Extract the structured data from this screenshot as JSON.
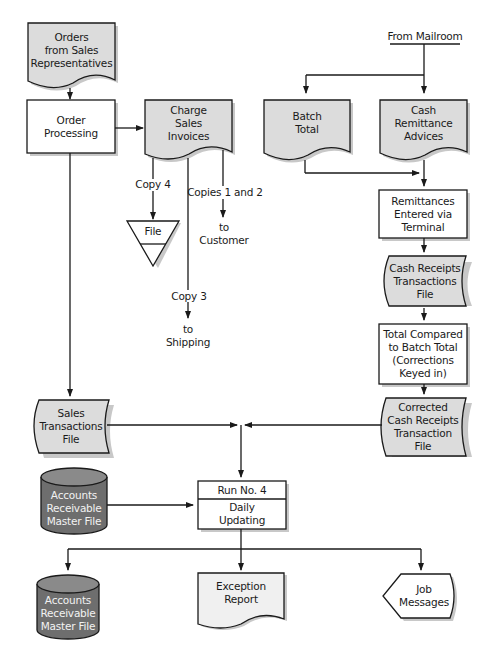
{
  "diagram": {
    "type": "system-flowchart",
    "colors": {
      "document_fill": "#dcdcdc",
      "light_document_fill": "#f0f0f0",
      "process_fill": "#ffffff",
      "disk_fill": "#6e6e6e",
      "disk_top": "#8a8a8a",
      "stroke": "#1a1a1a",
      "shadow": "#c8c8c8"
    },
    "nodes": {
      "orders": {
        "label": "Orders\nfrom Sales\nRepresentatives",
        "shape": "document"
      },
      "order_processing": {
        "label": "Order\nProcessing",
        "shape": "process"
      },
      "charge_invoices": {
        "label": "Charge\nSales\nInvoices",
        "shape": "document"
      },
      "file": {
        "label": "File",
        "shape": "offline-storage"
      },
      "from_mailroom": {
        "label": "From Mailroom",
        "shape": "annotation"
      },
      "batch_total": {
        "label": "Batch\nTotal",
        "shape": "document"
      },
      "cash_advices": {
        "label": "Cash\nRemittance\nAdvices",
        "shape": "document"
      },
      "remittances_entered": {
        "label": "Remittances\nEntered via\nTerminal",
        "shape": "process"
      },
      "cash_receipts_file": {
        "label": "Cash Receipts\nTransactions\nFile",
        "shape": "tape"
      },
      "total_compared": {
        "label": "Total Compared\nto Batch Total\n(Corrections\nKeyed in)",
        "shape": "process"
      },
      "corrected_file": {
        "label": "Corrected\nCash Receipts\nTransaction\nFile",
        "shape": "tape"
      },
      "sales_trans_file": {
        "label": "Sales\nTransactions\nFile",
        "shape": "tape"
      },
      "ar_master_in": {
        "label": "Accounts\nReceivable\nMaster File",
        "shape": "disk"
      },
      "run_header": {
        "label": "Run No. 4",
        "shape": "process-header"
      },
      "daily_updating": {
        "label": "Daily\nUpdating",
        "shape": "process"
      },
      "ar_master_out": {
        "label": "Accounts\nReceivable\nMaster File",
        "shape": "disk"
      },
      "exception_report": {
        "label": "Exception\nReport",
        "shape": "document"
      },
      "job_messages": {
        "label": "Job\nMessages",
        "shape": "display"
      }
    },
    "edge_labels": {
      "copy4": "Copy 4",
      "copies12": "Copies 1 and 2",
      "to_customer": "to\nCustomer",
      "copy3": "Copy 3",
      "to_shipping": "to\nShipping"
    }
  }
}
